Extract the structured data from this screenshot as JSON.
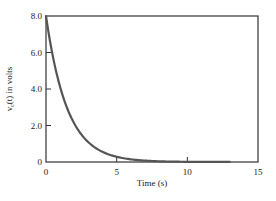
{
  "chart_data": {
    "type": "line",
    "title": "",
    "xlabel": "Time (s)",
    "ylabel": "v_c(t) in volts",
    "xlim": [
      0,
      15
    ],
    "ylim": [
      0,
      8.0
    ],
    "x_ticks": [
      "0",
      "5",
      "10",
      "15"
    ],
    "y_ticks": [
      "0",
      "2.0",
      "4.0",
      "6.0",
      "8.0"
    ],
    "grid": false,
    "legend": null,
    "series": [
      {
        "name": "v_c(t)",
        "color": "#555555",
        "formula": "8*exp(-t/1.5)",
        "x": [
          0,
          0.5,
          1,
          1.5,
          2,
          2.5,
          3,
          4,
          5,
          6,
          7,
          8,
          9,
          10,
          11,
          12,
          13
        ],
        "y": [
          8.0,
          5.73,
          4.11,
          2.94,
          2.11,
          1.51,
          1.08,
          0.56,
          0.29,
          0.15,
          0.08,
          0.04,
          0.02,
          0.01,
          0.01,
          0.0,
          0.0
        ]
      }
    ]
  }
}
